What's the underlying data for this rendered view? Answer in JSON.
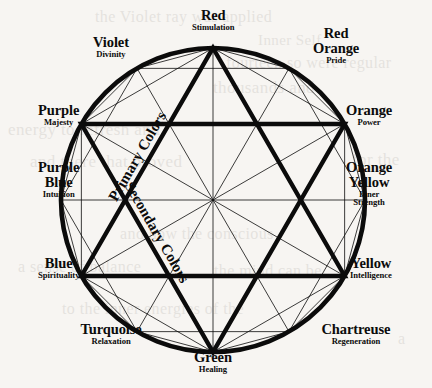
{
  "diagram": {
    "background_color": "#f7f5f2",
    "ink_color": "#0b0b0b",
    "center": {
      "x": 213,
      "y": 200
    },
    "radius": 152,
    "inner_labels": {
      "primary": "Primary Colors",
      "secondary": "Secondary Colors"
    },
    "wheel": [
      {
        "name": "Red",
        "name2": "",
        "meaning": "Stimulation",
        "angle": 90,
        "group": "primary"
      },
      {
        "name": "Red",
        "name2": "Orange",
        "meaning": "Pride",
        "angle": 60,
        "group": "tertiary"
      },
      {
        "name": "Orange",
        "name2": "",
        "meaning": "Power",
        "angle": 30,
        "group": "secondary"
      },
      {
        "name": "Orange",
        "name2": "Yellow",
        "meaning": "Inner Strength",
        "angle": 0,
        "group": "tertiary"
      },
      {
        "name": "Yellow",
        "name2": "",
        "meaning": "Intelligence",
        "angle": -30,
        "group": "primary"
      },
      {
        "name": "Chartreuse",
        "name2": "",
        "meaning": "Regeneration",
        "angle": -60,
        "group": "tertiary"
      },
      {
        "name": "Green",
        "name2": "",
        "meaning": "Healing",
        "angle": -90,
        "group": "secondary"
      },
      {
        "name": "Turquoise",
        "name2": "",
        "meaning": "Relaxation",
        "angle": -120,
        "group": "tertiary"
      },
      {
        "name": "Blue",
        "name2": "",
        "meaning": "Spirituality",
        "angle": -150,
        "group": "primary"
      },
      {
        "name": "Purple",
        "name2": "Blue",
        "meaning": "Intuition",
        "angle": 180,
        "group": "tertiary"
      },
      {
        "name": "Purple",
        "name2": "",
        "meaning": "Majesty",
        "angle": 150,
        "group": "secondary"
      },
      {
        "name": "Violet",
        "name2": "",
        "meaning": "Divinity",
        "angle": 120,
        "group": "tertiary"
      }
    ],
    "ghost_text": [
      {
        "text": "the Violet ray was applied",
        "x": 95,
        "y": 8,
        "size": 16
      },
      {
        "text": "Inner Self",
        "x": 258,
        "y": 32,
        "size": 15
      },
      {
        "text": "fourteen so were regular",
        "x": 226,
        "y": 54,
        "size": 16
      },
      {
        "text": "thousands and",
        "x": 213,
        "y": 78,
        "size": 17
      },
      {
        "text": "energy to refresh and",
        "x": 8,
        "y": 120,
        "size": 17
      },
      {
        "text": "and there that proved",
        "x": 30,
        "y": 152,
        "size": 17
      },
      {
        "text": "for the",
        "x": 352,
        "y": 150,
        "size": 17
      },
      {
        "text": "and how the conscious",
        "x": 120,
        "y": 225,
        "size": 16
      },
      {
        "text": "a sense of balance",
        "x": 18,
        "y": 258,
        "size": 16
      },
      {
        "text": "the mind can be",
        "x": 214,
        "y": 262,
        "size": 16
      },
      {
        "text": "to the inner energies of the",
        "x": 62,
        "y": 300,
        "size": 16
      },
      {
        "text": "a",
        "x": 398,
        "y": 330,
        "size": 16
      }
    ]
  }
}
